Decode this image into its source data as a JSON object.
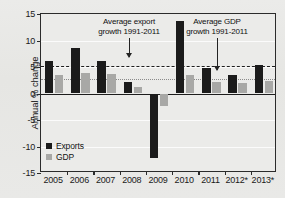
{
  "chart_data": {
    "type": "bar",
    "title": "",
    "subtitle": "",
    "xlabel": "",
    "ylabel": "Annual % change",
    "ylim": [
      -15,
      15
    ],
    "ytick_labels": [
      "15",
      "10",
      "5",
      "0",
      "-5",
      "-10",
      "-15"
    ],
    "ytick_values": [
      15,
      10,
      5,
      0,
      -5,
      -10,
      -15
    ],
    "grid": true,
    "legend_position": "bottom-left",
    "categories": [
      "2005",
      "2006",
      "2007",
      "2008",
      "2009",
      "2010",
      "2011",
      "2012*",
      "2013*"
    ],
    "series": [
      {
        "name": "Exports",
        "color": "#1b1b1b",
        "values": [
          6.2,
          8.6,
          6.2,
          2.2,
          -12.2,
          13.7,
          4.8,
          3.5,
          5.3
        ]
      },
      {
        "name": "GDP",
        "color": "#a8a8a6",
        "values": [
          3.5,
          3.9,
          3.7,
          1.3,
          -2.3,
          3.5,
          2.2,
          2.0,
          2.4
        ]
      }
    ],
    "reference_lines": [
      {
        "name": "Average export growth 1991-2011",
        "value": 5.2,
        "style": "dashed",
        "color": "#1f1f1f"
      },
      {
        "name": "Average GDP growth 1991-2011",
        "value": 2.8,
        "style": "dotted",
        "color": "#8a8a8a"
      }
    ],
    "annotations": [
      {
        "id": "export-average",
        "line1": "Average export",
        "line2": "growth 1991-2011",
        "points_to": "Average export growth reference line"
      },
      {
        "id": "gdp-average",
        "line1": "Average GDP",
        "line2": "growth 1991-2011",
        "points_to": "Average GDP growth reference line"
      }
    ]
  }
}
